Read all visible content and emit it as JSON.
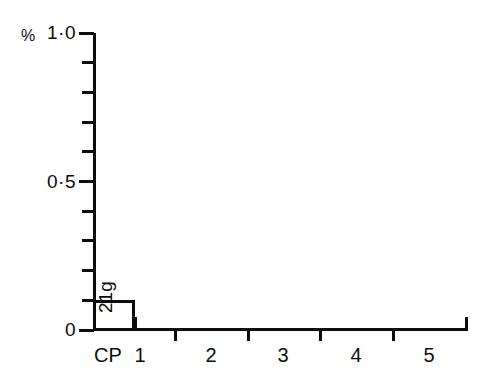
{
  "chart_data": {
    "type": "bar",
    "title": "",
    "subtitle": "",
    "xlabel": "",
    "ylabel": "%",
    "categories": [
      "CP",
      "1",
      "2",
      "3",
      "4",
      "5"
    ],
    "values": [
      0.1,
      0,
      0,
      0,
      0,
      0
    ],
    "ylim": [
      0,
      1.0
    ],
    "y_major_ticks": [
      "0",
      "0·5",
      "1·0"
    ],
    "y_major_values": [
      0,
      0.5,
      1.0
    ],
    "y_minor_step": 0.1,
    "grid": false,
    "legend": null,
    "bar_fill": "#ffffff",
    "bar_stroke": "#0d0d0d",
    "annotations": [
      {
        "text": "21g",
        "category": "CP",
        "orientation": "vertical-bottom-to-top"
      }
    ]
  },
  "axes": {
    "y": {
      "unit_label": "%",
      "ticks": [
        {
          "label": "1·0",
          "value": 1.0,
          "major": true
        },
        {
          "label": "",
          "value": 0.9,
          "major": false
        },
        {
          "label": "",
          "value": 0.8,
          "major": false
        },
        {
          "label": "",
          "value": 0.7,
          "major": false
        },
        {
          "label": "",
          "value": 0.6,
          "major": false
        },
        {
          "label": "0·5",
          "value": 0.5,
          "major": true
        },
        {
          "label": "",
          "value": 0.4,
          "major": false
        },
        {
          "label": "",
          "value": 0.3,
          "major": false
        },
        {
          "label": "",
          "value": 0.2,
          "major": false
        },
        {
          "label": "",
          "value": 0.1,
          "major": false
        },
        {
          "label": "0",
          "value": 0.0,
          "major": true
        }
      ]
    },
    "x": {
      "labels": [
        "CP",
        "1",
        "2",
        "3",
        "4",
        "5"
      ]
    }
  },
  "colors": {
    "ink": "#0d0d0d",
    "background": "#ffffff"
  }
}
